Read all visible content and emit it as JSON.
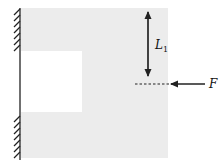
{
  "diagram": {
    "type": "mechanics-free-body",
    "labels": {
      "length": "L",
      "length_subscript": "1",
      "force": "F"
    },
    "colors": {
      "plate": "#ececec",
      "cutout": "#ffffff",
      "line": "#222222",
      "background": "#ffffff"
    },
    "elements": [
      "fixed-wall-support",
      "shaded-plate",
      "rectangular-cutout",
      "dimension-arrow-L1",
      "dashed-reference-line",
      "force-arrow-F"
    ]
  }
}
